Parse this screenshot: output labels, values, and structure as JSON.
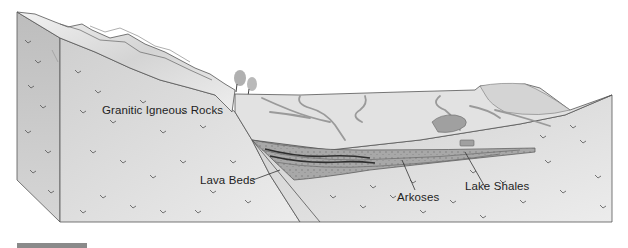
{
  "diagram": {
    "type": "geological-block-diagram",
    "labels": {
      "granitic": "Granitic Igneous Rocks",
      "lava": "Lava Beds",
      "arkoses": "Arkoses",
      "shales": "Lake Shales"
    },
    "colors": {
      "rock_face": "#d9d9d9",
      "rock_side": "#c4c4c4",
      "mountains": "#e6e6e6",
      "basin_surface": "#e2e2e2",
      "strata": "#a8a8a8",
      "lava_bed": "#3a3a3a",
      "rivers": "#9a9a9a",
      "outline": "#555555",
      "bottom_bar": "#8a8a8a"
    }
  }
}
